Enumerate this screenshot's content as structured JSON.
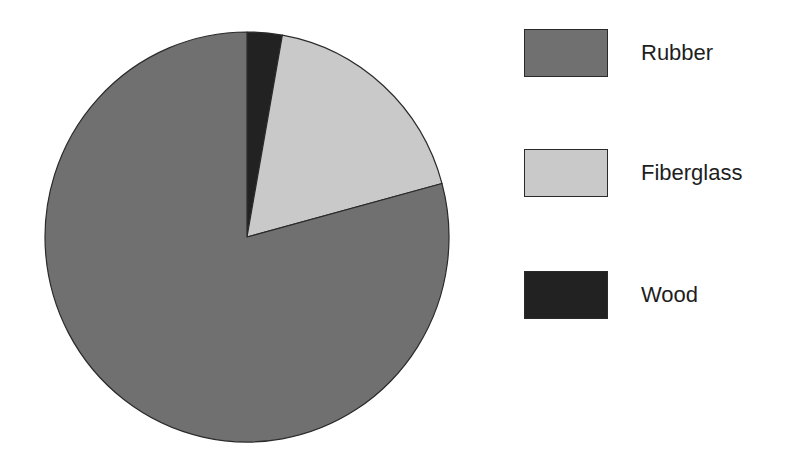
{
  "chart_data": {
    "type": "pie",
    "title": "",
    "start_angle_deg": 0,
    "direction": "clockwise",
    "slices": [
      {
        "label": "Wood",
        "value": 2.8,
        "color": "#222222"
      },
      {
        "label": "Fiberglass",
        "value": 18.0,
        "color": "#c9c9c9"
      },
      {
        "label": "Rubber",
        "value": 79.2,
        "color": "#707070"
      }
    ],
    "legend": {
      "position": "right",
      "entries": [
        {
          "label": "Rubber",
          "color": "#707070"
        },
        {
          "label": "Fiberglass",
          "color": "#c9c9c9"
        },
        {
          "label": "Wood",
          "color": "#222222"
        }
      ]
    },
    "units": "percent (estimated)"
  },
  "legend": {
    "items": [
      {
        "label": "Rubber",
        "color": "#707070"
      },
      {
        "label": "Fiberglass",
        "color": "#c9c9c9"
      },
      {
        "label": "Wood",
        "color": "#222222"
      }
    ]
  },
  "style": {
    "outline_color": "#2a2a2a"
  }
}
